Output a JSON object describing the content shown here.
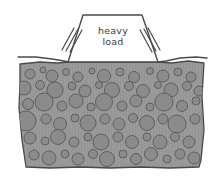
{
  "figure": {
    "type": "engineering-sketch",
    "title_visible": false,
    "background_color": "#ffffff",
    "style": "hand-drawn line sketch"
  },
  "load_block": {
    "name": "heavy-load-block",
    "label_line_1": "heavy",
    "label_line_2": "load",
    "shape": "trapezoid",
    "fill_color": "#ffffff",
    "stroke_color": "#4a4a4a",
    "top_left_x": 83,
    "top_right_x": 142,
    "top_y": 15,
    "base_left_x": 68,
    "base_right_x": 158,
    "base_y": 62
  },
  "pressure_lines": {
    "name": "pressure-motion-lines",
    "count_per_side": 3,
    "stroke_color": "#4a4a4a",
    "left": [
      {
        "x1": 62,
        "y1": 50,
        "x2": 74,
        "y2": 28
      },
      {
        "x1": 66,
        "y1": 51,
        "x2": 78,
        "y2": 29
      },
      {
        "x1": 70,
        "y1": 52,
        "x2": 82,
        "y2": 30
      }
    ],
    "right": [
      {
        "x1": 160,
        "y1": 50,
        "x2": 148,
        "y2": 28
      },
      {
        "x1": 156,
        "y1": 51,
        "x2": 144,
        "y2": 29
      },
      {
        "x1": 152,
        "y1": 52,
        "x2": 140,
        "y2": 30
      }
    ]
  },
  "ground": {
    "name": "ground-surface",
    "stroke_color": "#4a4a4a",
    "left_surface_y": 59,
    "right_surface_y": 59,
    "settled_y": 62
  },
  "soil_mass": {
    "name": "soil-aggregate-mass",
    "matrix_color": "#9a9a9a",
    "pebble_color": "#8b8b8b",
    "pebble_stroke_color": "#5a5a5a",
    "outline_color": "#4a4a4a",
    "top_y": 62,
    "bottom_y": 168,
    "left_x": 18,
    "right_x": 205,
    "description": "gravel and cobble aggregate fill beneath loaded footing"
  },
  "chart_data": {
    "type": "scatter",
    "xlabel": "",
    "ylabel": "",
    "series": [
      {
        "name": "aggregate-particles",
        "points": [
          {
            "cx": 30,
            "cy": 74,
            "r": 5
          },
          {
            "cx": 43,
            "cy": 70,
            "r": 3
          },
          {
            "cx": 52,
            "cy": 76,
            "r": 6
          },
          {
            "cx": 66,
            "cy": 72,
            "r": 3.5
          },
          {
            "cx": 78,
            "cy": 77,
            "r": 5
          },
          {
            "cx": 92,
            "cy": 71,
            "r": 3
          },
          {
            "cx": 104,
            "cy": 76,
            "r": 6.5
          },
          {
            "cx": 120,
            "cy": 72,
            "r": 4
          },
          {
            "cx": 134,
            "cy": 77,
            "r": 5.5
          },
          {
            "cx": 150,
            "cy": 71,
            "r": 3.5
          },
          {
            "cx": 163,
            "cy": 76,
            "r": 6
          },
          {
            "cx": 178,
            "cy": 72,
            "r": 4
          },
          {
            "cx": 191,
            "cy": 77,
            "r": 5
          },
          {
            "cx": 24,
            "cy": 88,
            "r": 7
          },
          {
            "cx": 40,
            "cy": 85,
            "r": 4.5
          },
          {
            "cx": 55,
            "cy": 90,
            "r": 8
          },
          {
            "cx": 72,
            "cy": 86,
            "r": 4
          },
          {
            "cx": 85,
            "cy": 91,
            "r": 6
          },
          {
            "cx": 99,
            "cy": 85,
            "r": 3.5
          },
          {
            "cx": 112,
            "cy": 90,
            "r": 7.5
          },
          {
            "cx": 129,
            "cy": 86,
            "r": 4.5
          },
          {
            "cx": 143,
            "cy": 91,
            "r": 6.5
          },
          {
            "cx": 158,
            "cy": 85,
            "r": 3.5
          },
          {
            "cx": 171,
            "cy": 90,
            "r": 7
          },
          {
            "cx": 187,
            "cy": 86,
            "r": 4.5
          },
          {
            "cx": 199,
            "cy": 91,
            "r": 5
          },
          {
            "cx": 28,
            "cy": 104,
            "r": 5.5
          },
          {
            "cx": 44,
            "cy": 102,
            "r": 9
          },
          {
            "cx": 62,
            "cy": 106,
            "r": 5
          },
          {
            "cx": 76,
            "cy": 101,
            "r": 7
          },
          {
            "cx": 91,
            "cy": 107,
            "r": 4
          },
          {
            "cx": 104,
            "cy": 102,
            "r": 8.5
          },
          {
            "cx": 122,
            "cy": 106,
            "r": 5
          },
          {
            "cx": 136,
            "cy": 101,
            "r": 6
          },
          {
            "cx": 150,
            "cy": 107,
            "r": 4
          },
          {
            "cx": 164,
            "cy": 102,
            "r": 9
          },
          {
            "cx": 182,
            "cy": 106,
            "r": 5.5
          },
          {
            "cx": 196,
            "cy": 101,
            "r": 4
          },
          {
            "cx": 26,
            "cy": 121,
            "r": 10
          },
          {
            "cx": 46,
            "cy": 119,
            "r": 5
          },
          {
            "cx": 60,
            "cy": 124,
            "r": 6.5
          },
          {
            "cx": 75,
            "cy": 118,
            "r": 4
          },
          {
            "cx": 88,
            "cy": 123,
            "r": 8
          },
          {
            "cx": 105,
            "cy": 119,
            "r": 5
          },
          {
            "cx": 119,
            "cy": 124,
            "r": 6
          },
          {
            "cx": 133,
            "cy": 118,
            "r": 4.5
          },
          {
            "cx": 147,
            "cy": 123,
            "r": 7.5
          },
          {
            "cx": 163,
            "cy": 119,
            "r": 5
          },
          {
            "cx": 177,
            "cy": 124,
            "r": 9
          },
          {
            "cx": 195,
            "cy": 119,
            "r": 5
          },
          {
            "cx": 30,
            "cy": 138,
            "r": 6
          },
          {
            "cx": 45,
            "cy": 141,
            "r": 4
          },
          {
            "cx": 58,
            "cy": 137,
            "r": 7.5
          },
          {
            "cx": 74,
            "cy": 142,
            "r": 5
          },
          {
            "cx": 88,
            "cy": 137,
            "r": 4
          },
          {
            "cx": 101,
            "cy": 142,
            "r": 8
          },
          {
            "cx": 118,
            "cy": 137,
            "r": 5
          },
          {
            "cx": 132,
            "cy": 142,
            "r": 6.5
          },
          {
            "cx": 147,
            "cy": 137,
            "r": 4
          },
          {
            "cx": 160,
            "cy": 142,
            "r": 7
          },
          {
            "cx": 175,
            "cy": 137,
            "r": 4.5
          },
          {
            "cx": 189,
            "cy": 142,
            "r": 6
          },
          {
            "cx": 34,
            "cy": 155,
            "r": 5
          },
          {
            "cx": 49,
            "cy": 158,
            "r": 7
          },
          {
            "cx": 65,
            "cy": 154,
            "r": 4
          },
          {
            "cx": 78,
            "cy": 159,
            "r": 6
          },
          {
            "cx": 93,
            "cy": 154,
            "r": 4.5
          },
          {
            "cx": 107,
            "cy": 159,
            "r": 7.5
          },
          {
            "cx": 123,
            "cy": 154,
            "r": 4
          },
          {
            "cx": 136,
            "cy": 159,
            "r": 5.5
          },
          {
            "cx": 151,
            "cy": 154,
            "r": 6.5
          },
          {
            "cx": 167,
            "cy": 159,
            "r": 4
          },
          {
            "cx": 180,
            "cy": 154,
            "r": 5
          },
          {
            "cx": 194,
            "cy": 158,
            "r": 6
          }
        ]
      }
    ]
  }
}
